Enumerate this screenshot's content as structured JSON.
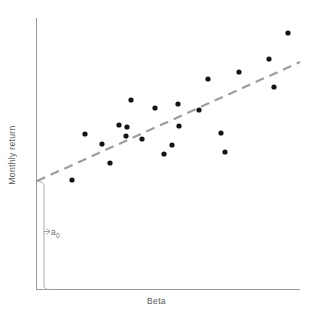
{
  "figure": {
    "type": "scatter-plot-with-regression",
    "background_color": "#ffffff",
    "width": 313,
    "height": 316
  },
  "axes": {
    "y_axis_label": "Monthly return",
    "x_axis_label": "Beta",
    "axis_color": "#9a9a9a",
    "x_axis_y": 289,
    "y_axis_x": 36,
    "x_axis_end": 300,
    "y_axis_top": 18
  },
  "annotation": {
    "intercept_label": "a",
    "intercept_subscript": "0",
    "bracket_color": "#a8a8a8",
    "bracket_top": 181,
    "bracket_bottom": 289
  },
  "regression": {
    "style": "dashed",
    "color": "#9d9d9d",
    "x1": 37,
    "y1": 181,
    "x2": 300,
    "y2": 62
  },
  "chart_data": {
    "type": "scatter",
    "title": "",
    "xlabel": "Beta",
    "ylabel": "Monthly return",
    "xlim": [
      0,
      313
    ],
    "ylim": [
      0,
      316
    ],
    "grid": false,
    "legend": "none",
    "axis_ticks": [],
    "point_color": "#141414",
    "point_radius": 2.6,
    "series": [
      {
        "name": "observations",
        "points": [
          {
            "x": 72,
            "y": 180
          },
          {
            "x": 85,
            "y": 134
          },
          {
            "x": 102,
            "y": 144
          },
          {
            "x": 110,
            "y": 163
          },
          {
            "x": 119,
            "y": 125
          },
          {
            "x": 126,
            "y": 136
          },
          {
            "x": 127,
            "y": 127
          },
          {
            "x": 131,
            "y": 100
          },
          {
            "x": 142,
            "y": 139
          },
          {
            "x": 155,
            "y": 108
          },
          {
            "x": 164,
            "y": 154
          },
          {
            "x": 172,
            "y": 145
          },
          {
            "x": 178,
            "y": 104
          },
          {
            "x": 179,
            "y": 126
          },
          {
            "x": 199,
            "y": 110
          },
          {
            "x": 208,
            "y": 79
          },
          {
            "x": 221,
            "y": 133
          },
          {
            "x": 225,
            "y": 152
          },
          {
            "x": 239,
            "y": 72
          },
          {
            "x": 269,
            "y": 59
          },
          {
            "x": 274,
            "y": 87
          },
          {
            "x": 288,
            "y": 33
          }
        ]
      }
    ],
    "trendline": {
      "name": "fitted regression line",
      "style": "dashed",
      "x": [
        37,
        300
      ],
      "y": [
        181,
        62
      ]
    },
    "annotations": [
      {
        "text": "a0",
        "role": "y-intercept bracket",
        "at_x": 51,
        "at_y": 231
      }
    ]
  }
}
